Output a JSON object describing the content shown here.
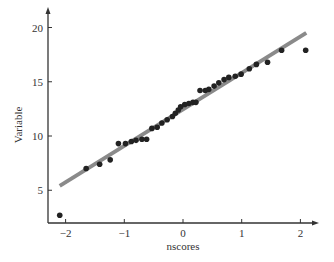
{
  "chart_data": {
    "type": "scatter",
    "title": "",
    "xlabel": "nscores",
    "ylabel": "Variable",
    "xlim": [
      -2.3,
      2.35
    ],
    "ylim": [
      2.0,
      22.0
    ],
    "grid": false,
    "legend": null,
    "x_ticks": [
      -2,
      -1,
      0,
      1,
      2
    ],
    "x_tick_labels": [
      "−2",
      "−1",
      "0",
      "1",
      "2"
    ],
    "y_ticks": [
      5,
      10,
      15,
      20
    ],
    "y_tick_labels": [
      "5",
      "10",
      "15",
      "20"
    ],
    "series": [
      {
        "name": "data",
        "kind": "points",
        "color": "#222222",
        "x": [
          -2.1,
          -1.65,
          -1.42,
          -1.24,
          -1.1,
          -0.98,
          -0.88,
          -0.8,
          -0.7,
          -0.62,
          -0.53,
          -0.44,
          -0.36,
          -0.27,
          -0.18,
          -0.13,
          -0.08,
          -0.04,
          0.03,
          0.1,
          0.17,
          0.22,
          0.29,
          0.38,
          0.44,
          0.53,
          0.61,
          0.7,
          0.78,
          0.89,
          0.99,
          1.13,
          1.25,
          1.44,
          1.68,
          2.09
        ],
        "y": [
          2.7,
          7.0,
          7.4,
          7.8,
          9.3,
          9.3,
          9.5,
          9.6,
          9.7,
          9.7,
          10.7,
          10.8,
          11.2,
          11.5,
          11.8,
          12.1,
          12.4,
          12.7,
          12.9,
          13.0,
          13.1,
          13.1,
          14.2,
          14.2,
          14.3,
          14.6,
          14.9,
          15.2,
          15.4,
          15.5,
          15.7,
          16.2,
          16.6,
          16.8,
          17.9,
          17.9
        ]
      },
      {
        "name": "reference line",
        "kind": "line",
        "color": "#8a8a8a",
        "x": [
          -2.1,
          2.1
        ],
        "y": [
          5.4,
          19.5
        ]
      }
    ]
  }
}
